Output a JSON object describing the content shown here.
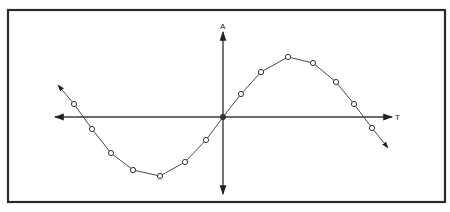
{
  "diagram": {
    "axes": {
      "vertical_label": "A",
      "horizontal_label": "T"
    },
    "colors": {
      "frame": "#2a2a2a",
      "axis": "#3a3a3a",
      "curve": "#4a4a4a",
      "point_fill": "#ffffff"
    },
    "curve": {
      "type": "sine",
      "start_arrow": [
        58,
        85
      ],
      "end_arrow": [
        388,
        148
      ],
      "points": [
        [
          74,
          104
        ],
        [
          92,
          129
        ],
        [
          111,
          153
        ],
        [
          133,
          170
        ],
        [
          160,
          176
        ],
        [
          185,
          162
        ],
        [
          206,
          140
        ],
        [
          223,
          117
        ],
        [
          241,
          94
        ],
        [
          261,
          72
        ],
        [
          288,
          57
        ],
        [
          313,
          63
        ],
        [
          336,
          82
        ],
        [
          354,
          104
        ],
        [
          372,
          128
        ]
      ],
      "origin_index": 7
    }
  }
}
